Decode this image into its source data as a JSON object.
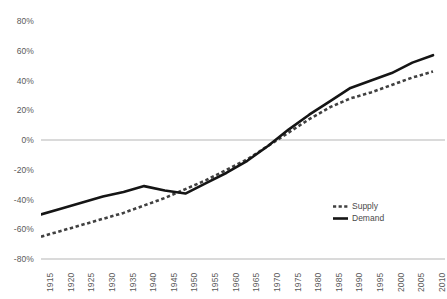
{
  "chart_data": {
    "type": "line",
    "title": "",
    "subtitle": "",
    "xlabel": "",
    "ylabel": "",
    "x": [
      1915,
      1920,
      1925,
      1930,
      1935,
      1940,
      1945,
      1950,
      1955,
      1960,
      1965,
      1970,
      1975,
      1980,
      1985,
      1990,
      1995,
      2000,
      2005,
      2010
    ],
    "categories": [
      "1915",
      "1920",
      "1925",
      "1930",
      "1935",
      "1940",
      "1945",
      "1950",
      "1955",
      "1960",
      "1965",
      "1970",
      "1975",
      "1980",
      "1985",
      "1990",
      "1995",
      "2000",
      "2005",
      "2010"
    ],
    "series": [
      {
        "name": "Supply",
        "style": "dashed",
        "color": "#404040",
        "values": [
          -65,
          -61,
          -57,
          -53,
          -49,
          -44,
          -39,
          -33,
          -27,
          -20,
          -13,
          -4,
          5,
          14,
          22,
          28,
          32,
          37,
          42,
          46
        ]
      },
      {
        "name": "Demand",
        "style": "solid",
        "color": "#151515",
        "values": [
          -50,
          -46,
          -42,
          -38,
          -35,
          -31,
          -34,
          -36,
          -29,
          -22,
          -14,
          -4,
          7,
          17,
          26,
          35,
          40,
          45,
          52,
          57
        ]
      }
    ],
    "ylim": [
      -80,
      80
    ],
    "yticks": [
      80,
      60,
      40,
      20,
      0,
      -20,
      -40,
      -60,
      -80
    ],
    "ytick_labels": [
      "80%",
      "60%",
      "40%",
      "20%",
      "0%",
      "-20%",
      "-40%",
      "-60%",
      "-80%"
    ],
    "grid": false,
    "zero_line": true,
    "baseline_axis": -80,
    "legend": {
      "position": "bottom-right",
      "entries": [
        {
          "label": "Supply",
          "style": "dashed"
        },
        {
          "label": "Demand",
          "style": "solid"
        }
      ]
    },
    "colors": {
      "supply": "#404040",
      "demand": "#151515",
      "axis": "#b0b0b0",
      "tick_text": "#5a5a5a",
      "background": "#ffffff"
    }
  }
}
